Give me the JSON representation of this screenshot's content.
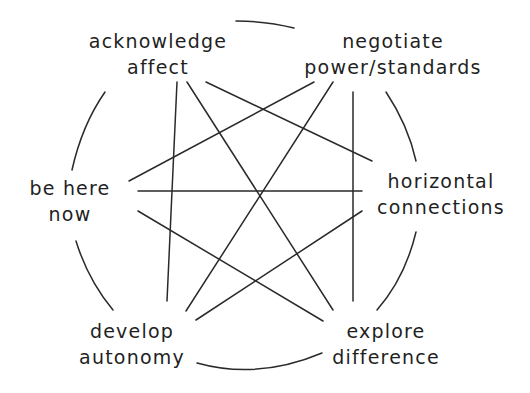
{
  "diagram": {
    "type": "network",
    "layout": "circular",
    "stroke_color": "#2a2a2a",
    "text_color": "#1f1f1f",
    "background_color": "#ffffff",
    "nodes": [
      {
        "id": "acknowledge-affect",
        "line1": "acknowledge",
        "line2": "affect"
      },
      {
        "id": "negotiate-power",
        "line1": "negotiate",
        "line2": "power/standards"
      },
      {
        "id": "horizontal-connections",
        "line1": "horizontal",
        "line2": "connections"
      },
      {
        "id": "explore-difference",
        "line1": "explore",
        "line2": "difference"
      },
      {
        "id": "develop-autonomy",
        "line1": "develop",
        "line2": "autonomy"
      },
      {
        "id": "be-here-now",
        "line1": "be here",
        "line2": "now"
      }
    ],
    "edges": [
      {
        "from": "acknowledge-affect",
        "to": "develop-autonomy"
      },
      {
        "from": "acknowledge-affect",
        "to": "explore-difference"
      },
      {
        "from": "acknowledge-affect",
        "to": "horizontal-connections"
      },
      {
        "from": "negotiate-power",
        "to": "be-here-now"
      },
      {
        "from": "negotiate-power",
        "to": "develop-autonomy"
      },
      {
        "from": "negotiate-power",
        "to": "explore-difference"
      },
      {
        "from": "be-here-now",
        "to": "horizontal-connections"
      },
      {
        "from": "be-here-now",
        "to": "explore-difference"
      },
      {
        "from": "horizontal-connections",
        "to": "develop-autonomy"
      }
    ],
    "outer_ring": "circle segments connecting adjacent nodes"
  }
}
